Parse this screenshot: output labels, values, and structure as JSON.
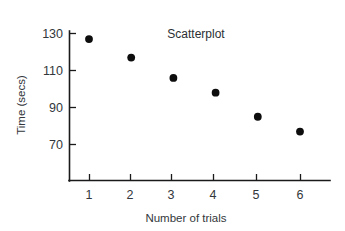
{
  "chart_data": {
    "type": "scatter",
    "title": "Scatterplot",
    "xlabel": "Number of trials",
    "ylabel": "Time (secs)",
    "x": [
      1,
      2,
      3,
      4,
      5,
      6
    ],
    "values": [
      127,
      117,
      106,
      98,
      85,
      77
    ],
    "xticks": [
      "1",
      "2",
      "3",
      "4",
      "5",
      "6"
    ],
    "yticks": [
      "70",
      "90",
      "110",
      "130"
    ],
    "ytick_values": [
      70,
      90,
      110,
      130
    ],
    "xlim": [
      0.5,
      6.6
    ],
    "ylim": [
      55,
      133
    ],
    "grid": false,
    "legend": "none",
    "marker_color": "#0d0d0d",
    "axis_color": "#1a1a1a",
    "background_color": "#ffffff",
    "points": [
      {
        "x": 1,
        "y": 127
      },
      {
        "x": 2,
        "y": 117
      },
      {
        "x": 3,
        "y": 106
      },
      {
        "x": 4,
        "y": 98
      },
      {
        "x": 5,
        "y": 85
      },
      {
        "x": 6,
        "y": 77
      }
    ]
  }
}
